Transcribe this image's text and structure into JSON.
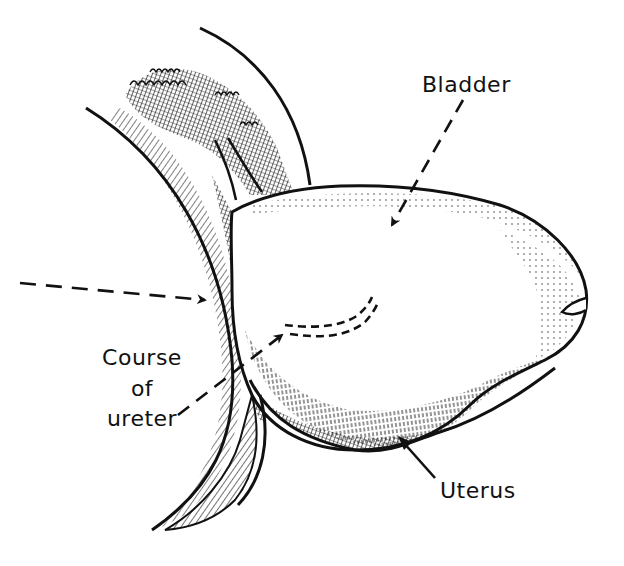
{
  "figure": {
    "type": "anatomical-line-illustration",
    "ink_color": "#111111",
    "background": "#ffffff"
  },
  "labels": {
    "bladder": "Bladder",
    "course_line1": "Course",
    "course_line2": "of",
    "course_line3": "ureter",
    "uterus": "Uterus"
  }
}
